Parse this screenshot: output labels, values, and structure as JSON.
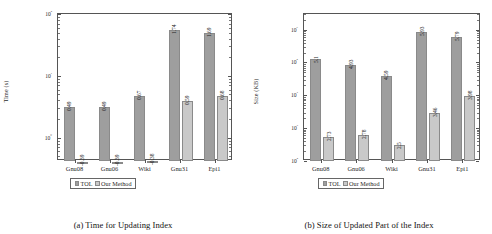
{
  "figure": {
    "panels": [
      {
        "id": "panel-a",
        "caption": "(a) Time for Updating Index",
        "chart_data": {
          "type": "bar",
          "title": "",
          "xlabel": "",
          "ylabel": "Time (s)",
          "categories": [
            "Gnu08",
            "Gnu06",
            "Wiki",
            "Gnu31",
            "Epi1"
          ],
          "yscale": "log",
          "ylim": [
            0.42,
            100
          ],
          "ytick_labels": [
            "10⁰",
            "10¹",
            "10²"
          ],
          "ytick_values": [
            1,
            10,
            100
          ],
          "grid": false,
          "legend_position": "below-axes",
          "series": [
            {
              "name": "TOL",
              "color": "#9e9e9e",
              "label_kind": "log10",
              "labels": [
                "0.49",
                "0.49",
                "0.67",
                "1.74",
                "1.69"
              ],
              "values": [
                3.09,
                3.09,
                4.68,
                54.95,
                48.98
              ]
            },
            {
              "name": "Our Method",
              "color": "#c9c9c9",
              "label_kind": "log10",
              "labels": [
                "-0.39",
                "-0.39",
                "-0.38",
                "0.59",
                "0.68"
              ],
              "values": [
                0.41,
                0.41,
                0.42,
                3.89,
                4.79
              ]
            }
          ]
        }
      },
      {
        "id": "panel-b",
        "caption": "(b) Size of Updated Part of the Index",
        "chart_data": {
          "type": "bar",
          "title": "",
          "xlabel": "",
          "ylabel": "Size (KB)",
          "categories": [
            "Gnu08",
            "Gnu06",
            "Wiki",
            "Gnu31",
            "Epi1"
          ],
          "yscale": "log",
          "ylim": [
            100,
            3000000
          ],
          "ytick_labels": [
            "10²",
            "10³",
            "10⁴",
            "10⁵",
            "10⁶"
          ],
          "ytick_values": [
            100,
            1000,
            10000,
            100000,
            1000000
          ],
          "grid": false,
          "legend_position": "below-axes",
          "series": [
            {
              "name": "TOL",
              "color": "#9e9e9e",
              "label_kind": "log10",
              "labels": [
                "5.1",
                "4.93",
                "4.59",
                "5.93",
                "5.79"
              ],
              "values": [
                125893,
                85114,
                38905,
                851138,
                616595
              ]
            },
            {
              "name": "Our Method",
              "color": "#c9c9c9",
              "label_kind": "log10",
              "labels": [
                "2.73",
                "2.78",
                "2.5",
                "3.46",
                "3.98"
              ],
              "values": [
                537,
                603,
                316,
                2884,
                9550
              ]
            }
          ]
        }
      }
    ],
    "legend": {
      "items": [
        {
          "label": "TOL",
          "color": "#9e9e9e"
        },
        {
          "label": "Our Method",
          "color": "#c9c9c9"
        }
      ]
    }
  }
}
